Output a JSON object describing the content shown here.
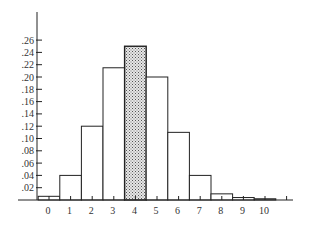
{
  "chart_data": {
    "type": "bar",
    "title": "",
    "xlabel": "",
    "ylabel": "",
    "categories": [
      "0",
      "1",
      "2",
      "3",
      "4",
      "5",
      "6",
      "7",
      "8",
      "9",
      "10"
    ],
    "values": [
      0.006,
      0.04,
      0.12,
      0.215,
      0.25,
      0.2,
      0.11,
      0.04,
      0.01,
      0.004,
      0.002
    ],
    "highlighted_category": "4",
    "highlight_fill": "stippled gray",
    "ylim": [
      0,
      0.28
    ],
    "y_ticks": [
      ".02",
      ".04",
      ".06",
      ".08",
      ".10",
      ".12",
      ".14",
      ".16",
      ".18",
      ".20",
      ".22",
      ".24",
      ".26"
    ],
    "x_ticks": [
      "0",
      "1",
      "2",
      "3",
      "4",
      "5",
      "6",
      "7",
      "8",
      "9",
      "10"
    ],
    "grid": false,
    "legend": null
  },
  "colors": {
    "bar_fill": "#ffffff",
    "bar_stroke": "#222222",
    "highlight_fill": "#b8b8b8",
    "axis": "#222222"
  }
}
